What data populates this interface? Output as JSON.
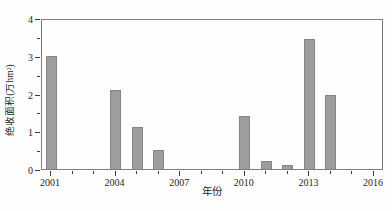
{
  "chart_data": {
    "type": "bar",
    "title": "",
    "xlabel": "年份",
    "ylabel": "绝收面积(万hm²)",
    "categories": [
      2001,
      2004,
      2005,
      2006,
      2010,
      2011,
      2012,
      2013,
      2014
    ],
    "values": [
      3.0,
      2.1,
      1.1,
      0.5,
      1.4,
      0.2,
      0.1,
      3.45,
      1.95
    ],
    "x_range": [
      2001,
      2016
    ],
    "x_major_ticks": [
      2001,
      2004,
      2007,
      2010,
      2013,
      2016
    ],
    "x_minor_tick_step": 1,
    "ylim": [
      0,
      4
    ],
    "y_major_ticks": [
      0,
      1,
      2,
      3,
      4
    ],
    "y_minor_tick_step": 0.5,
    "grid": false,
    "legend": null,
    "bar_color": "#9d9d9d",
    "axis_color": "#3f3f3f"
  }
}
